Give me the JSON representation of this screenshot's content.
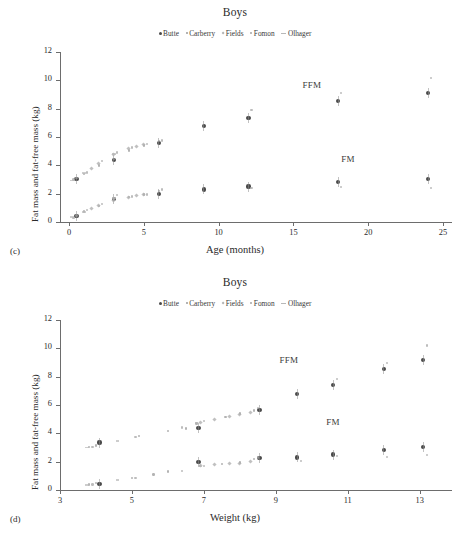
{
  "figure": {
    "panels": [
      {
        "panel_label": "(c)",
        "title": "Boys",
        "xlabel": "Age (months)",
        "ylabel": "Fat mass and fat-free mass (kg)",
        "annotations": [
          "FFM",
          "FM"
        ]
      },
      {
        "panel_label": "(d)",
        "title": "Boys",
        "xlabel": "Weight (kg)",
        "ylabel": "Fat mass and fat-free mass (kg)",
        "annotations": [
          "FFM",
          "FM"
        ]
      }
    ],
    "legend_entries": [
      {
        "label": "Butte",
        "marker": "filled-circle-marker",
        "color": "#4a4a4a"
      },
      {
        "label": "Carberry",
        "marker": "small-dot-marker",
        "color": "#9a9a9a"
      },
      {
        "label": "Fields",
        "marker": "diamond-marker",
        "color": "#b0b0b0"
      },
      {
        "label": "Fomon",
        "marker": "dot-marker",
        "color": "#a5a5a5"
      },
      {
        "label": "Olhager",
        "marker": "dash-marker",
        "color": "#b8b8b8"
      }
    ]
  },
  "chart_data": [
    {
      "type": "scatter",
      "panel": "(c)",
      "title": "Boys",
      "xlabel": "Age (months)",
      "ylabel": "Fat mass and fat-free mass (kg)",
      "xlim": [
        -0.6,
        25.6
      ],
      "ylim": [
        0,
        12
      ],
      "xticks": [
        0,
        5,
        10,
        15,
        20,
        25
      ],
      "yticks": [
        0,
        2,
        4,
        6,
        8,
        10,
        12
      ],
      "grid": false,
      "legend_position": "top-center",
      "annotations": [
        {
          "text": "FFM",
          "x": 15.6,
          "y": 9.6
        },
        {
          "text": "FM",
          "x": 18.2,
          "y": 4.4
        }
      ],
      "series": [
        {
          "name": "Butte",
          "measure": "FFM",
          "color": "#4a4a4a",
          "marker": "filled-circle",
          "points": [
            {
              "x": 0.5,
              "y": 3.05
            },
            {
              "x": 3,
              "y": 4.35
            },
            {
              "x": 6,
              "y": 5.6
            },
            {
              "x": 9,
              "y": 6.75
            },
            {
              "x": 12,
              "y": 7.35
            },
            {
              "x": 18,
              "y": 8.55
            },
            {
              "x": 24,
              "y": 9.1
            }
          ]
        },
        {
          "name": "Butte",
          "measure": "FM",
          "color": "#4a4a4a",
          "marker": "filled-circle",
          "points": [
            {
              "x": 0.5,
              "y": 0.45
            },
            {
              "x": 3,
              "y": 1.6
            },
            {
              "x": 6,
              "y": 2.0
            },
            {
              "x": 9,
              "y": 2.3
            },
            {
              "x": 12,
              "y": 2.5
            },
            {
              "x": 18,
              "y": 2.8
            },
            {
              "x": 24,
              "y": 3.05
            }
          ]
        },
        {
          "name": "Carberry",
          "measure": "FFM",
          "color": "#9a9a9a",
          "marker": "dot",
          "points": [
            {
              "x": 0.5,
              "y": 3.1
            },
            {
              "x": 1,
              "y": 3.4
            },
            {
              "x": 2,
              "y": 4.0
            },
            {
              "x": 3,
              "y": 4.45
            },
            {
              "x": 4,
              "y": 5.05
            },
            {
              "x": 5,
              "y": 5.4
            },
            {
              "x": 6,
              "y": 5.7
            }
          ]
        },
        {
          "name": "Carberry",
          "measure": "FM",
          "color": "#9a9a9a",
          "marker": "dot",
          "points": [
            {
              "x": 0.5,
              "y": 0.45
            },
            {
              "x": 1,
              "y": 0.75
            },
            {
              "x": 2,
              "y": 1.15
            },
            {
              "x": 3,
              "y": 1.65
            },
            {
              "x": 4,
              "y": 1.75
            },
            {
              "x": 5,
              "y": 1.95
            },
            {
              "x": 6,
              "y": 2.2
            }
          ]
        },
        {
          "name": "Fields",
          "measure": "FFM",
          "color": "#b0b0b0",
          "marker": "diamond",
          "points": [
            {
              "x": 1.5,
              "y": 3.75
            },
            {
              "x": 2,
              "y": 4.1
            },
            {
              "x": 3,
              "y": 4.75
            },
            {
              "x": 4,
              "y": 5.2
            },
            {
              "x": 4.5,
              "y": 5.35
            },
            {
              "x": 5,
              "y": 5.45
            }
          ]
        },
        {
          "name": "Fields",
          "measure": "FM",
          "color": "#b0b0b0",
          "marker": "diamond",
          "points": [
            {
              "x": 1.5,
              "y": 0.95
            },
            {
              "x": 2,
              "y": 1.2
            },
            {
              "x": 3,
              "y": 1.55
            },
            {
              "x": 4,
              "y": 1.75
            },
            {
              "x": 4.5,
              "y": 1.85
            },
            {
              "x": 5,
              "y": 1.95
            }
          ]
        },
        {
          "name": "Fomon",
          "measure": "FFM",
          "color": "#a5a5a5",
          "marker": "dot",
          "points": [
            {
              "x": 0.3,
              "y": 3.0
            },
            {
              "x": 1.2,
              "y": 3.5
            },
            {
              "x": 2.2,
              "y": 4.3
            },
            {
              "x": 3.2,
              "y": 4.9
            },
            {
              "x": 4.2,
              "y": 5.25
            },
            {
              "x": 5.2,
              "y": 5.5
            },
            {
              "x": 6.2,
              "y": 5.75
            },
            {
              "x": 12.2,
              "y": 7.9
            },
            {
              "x": 18.2,
              "y": 9.1
            },
            {
              "x": 24.2,
              "y": 10.15
            }
          ]
        },
        {
          "name": "Fomon",
          "measure": "FM",
          "color": "#a5a5a5",
          "marker": "dot",
          "points": [
            {
              "x": 0.3,
              "y": 0.3
            },
            {
              "x": 1.2,
              "y": 0.85
            },
            {
              "x": 2.2,
              "y": 1.25
            },
            {
              "x": 3.2,
              "y": 1.9
            },
            {
              "x": 4.2,
              "y": 1.8
            },
            {
              "x": 5.2,
              "y": 1.95
            },
            {
              "x": 6.2,
              "y": 2.3
            },
            {
              "x": 12.2,
              "y": 2.4
            },
            {
              "x": 18.2,
              "y": 2.45
            },
            {
              "x": 24.2,
              "y": 2.4
            }
          ]
        },
        {
          "name": "Olhager",
          "measure": "FFM",
          "color": "#b8b8b8",
          "marker": "dash",
          "points": [
            {
              "x": 0.2,
              "y": 2.95
            },
            {
              "x": 1.0,
              "y": 3.45
            },
            {
              "x": 3.0,
              "y": 4.8
            }
          ]
        },
        {
          "name": "Olhager",
          "measure": "FM",
          "color": "#b8b8b8",
          "marker": "dash",
          "points": [
            {
              "x": 0.2,
              "y": 0.35
            },
            {
              "x": 1.0,
              "y": 0.7
            },
            {
              "x": 3.0,
              "y": 1.7
            }
          ]
        }
      ]
    },
    {
      "type": "scatter",
      "panel": "(d)",
      "title": "Boys",
      "xlabel": "Weight (kg)",
      "ylabel": "Fat mass and fat-free mass (kg)",
      "xlim": [
        3,
        13.9
      ],
      "ylim": [
        0,
        12
      ],
      "xticks": [
        3,
        5,
        7,
        9,
        11,
        13
      ],
      "yticks": [
        0,
        2,
        4,
        6,
        8,
        10,
        12
      ],
      "grid": false,
      "legend_position": "top-center",
      "annotations": [
        {
          "text": "FFM",
          "x": 9.1,
          "y": 9.1
        },
        {
          "text": "FM",
          "x": 10.4,
          "y": 4.7
        }
      ],
      "series": [
        {
          "name": "Butte",
          "measure": "FFM",
          "color": "#4a4a4a",
          "marker": "filled-circle",
          "points": [
            {
              "x": 4.1,
              "y": 3.35
            },
            {
              "x": 6.85,
              "y": 4.4
            },
            {
              "x": 8.55,
              "y": 5.65
            },
            {
              "x": 9.6,
              "y": 6.75
            },
            {
              "x": 10.6,
              "y": 7.4
            },
            {
              "x": 12.0,
              "y": 8.55
            },
            {
              "x": 13.1,
              "y": 9.2
            }
          ]
        },
        {
          "name": "Butte",
          "measure": "FM",
          "color": "#4a4a4a",
          "marker": "filled-circle",
          "points": [
            {
              "x": 4.1,
              "y": 0.45
            },
            {
              "x": 6.85,
              "y": 1.95
            },
            {
              "x": 8.55,
              "y": 2.25
            },
            {
              "x": 9.6,
              "y": 2.3
            },
            {
              "x": 10.6,
              "y": 2.5
            },
            {
              "x": 12.0,
              "y": 2.8
            },
            {
              "x": 13.1,
              "y": 3.05
            }
          ]
        },
        {
          "name": "Carberry",
          "measure": "FFM",
          "color": "#9a9a9a",
          "marker": "dot",
          "points": [
            {
              "x": 3.8,
              "y": 3.05
            },
            {
              "x": 4.0,
              "y": 3.15
            },
            {
              "x": 5.2,
              "y": 3.8
            },
            {
              "x": 6.0,
              "y": 4.15
            },
            {
              "x": 6.5,
              "y": 4.35
            },
            {
              "x": 6.8,
              "y": 4.7
            },
            {
              "x": 7.6,
              "y": 5.15
            },
            {
              "x": 8.0,
              "y": 5.4
            },
            {
              "x": 8.4,
              "y": 5.6
            }
          ]
        },
        {
          "name": "Carberry",
          "measure": "FM",
          "color": "#9a9a9a",
          "marker": "dot",
          "points": [
            {
              "x": 3.8,
              "y": 0.4
            },
            {
              "x": 4.0,
              "y": 0.5
            },
            {
              "x": 5.0,
              "y": 0.85
            },
            {
              "x": 5.6,
              "y": 1.1
            },
            {
              "x": 6.0,
              "y": 1.3
            },
            {
              "x": 6.9,
              "y": 1.7
            },
            {
              "x": 7.5,
              "y": 1.85
            },
            {
              "x": 8.0,
              "y": 1.95
            },
            {
              "x": 8.4,
              "y": 2.2
            }
          ]
        },
        {
          "name": "Fields",
          "measure": "FFM",
          "color": "#b0b0b0",
          "marker": "diamond",
          "points": [
            {
              "x": 6.9,
              "y": 4.8
            },
            {
              "x": 7.3,
              "y": 5.0
            },
            {
              "x": 7.7,
              "y": 5.2
            },
            {
              "x": 8.0,
              "y": 5.35
            },
            {
              "x": 8.3,
              "y": 5.5
            }
          ]
        },
        {
          "name": "Fields",
          "measure": "FM",
          "color": "#b0b0b0",
          "marker": "diamond",
          "points": [
            {
              "x": 6.9,
              "y": 1.75
            },
            {
              "x": 7.3,
              "y": 1.8
            },
            {
              "x": 7.7,
              "y": 1.85
            },
            {
              "x": 8.0,
              "y": 1.9
            },
            {
              "x": 8.3,
              "y": 2.0
            }
          ]
        },
        {
          "name": "Fomon",
          "measure": "FFM",
          "color": "#a5a5a5",
          "marker": "dot",
          "points": [
            {
              "x": 3.9,
              "y": 3.05
            },
            {
              "x": 5.1,
              "y": 3.75
            },
            {
              "x": 6.4,
              "y": 4.4
            },
            {
              "x": 7.0,
              "y": 4.85
            },
            {
              "x": 8.5,
              "y": 5.8
            },
            {
              "x": 10.7,
              "y": 7.85
            },
            {
              "x": 12.1,
              "y": 8.95
            },
            {
              "x": 13.2,
              "y": 10.2
            }
          ]
        },
        {
          "name": "Fomon",
          "measure": "FM",
          "color": "#a5a5a5",
          "marker": "dot",
          "points": [
            {
              "x": 3.9,
              "y": 0.4
            },
            {
              "x": 5.1,
              "y": 0.85
            },
            {
              "x": 6.4,
              "y": 1.35
            },
            {
              "x": 7.0,
              "y": 1.7
            },
            {
              "x": 8.5,
              "y": 2.3
            },
            {
              "x": 9.7,
              "y": 2.05
            },
            {
              "x": 10.7,
              "y": 2.4
            },
            {
              "x": 12.1,
              "y": 2.35
            },
            {
              "x": 13.2,
              "y": 2.45
            }
          ]
        },
        {
          "name": "Olhager",
          "measure": "FFM",
          "color": "#b8b8b8",
          "marker": "dash",
          "points": [
            {
              "x": 3.75,
              "y": 3.0
            },
            {
              "x": 4.6,
              "y": 3.45
            },
            {
              "x": 6.8,
              "y": 4.75
            }
          ]
        },
        {
          "name": "Olhager",
          "measure": "FM",
          "color": "#b8b8b8",
          "marker": "dash",
          "points": [
            {
              "x": 3.75,
              "y": 0.35
            },
            {
              "x": 4.6,
              "y": 0.7
            },
            {
              "x": 6.9,
              "y": 1.65
            }
          ]
        }
      ]
    }
  ]
}
